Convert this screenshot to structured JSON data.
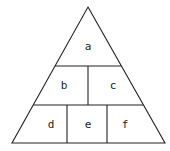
{
  "diagram": {
    "type": "pyramid",
    "stroke_color": "#222222",
    "fill_color": "#ffffff",
    "levels": [
      {
        "row": 1,
        "cells": [
          {
            "id": "a",
            "label": "a"
          }
        ]
      },
      {
        "row": 2,
        "cells": [
          {
            "id": "b",
            "label": "b"
          },
          {
            "id": "c",
            "label": "c"
          }
        ]
      },
      {
        "row": 3,
        "cells": [
          {
            "id": "d",
            "label": "d"
          },
          {
            "id": "e",
            "label": "e"
          },
          {
            "id": "f",
            "label": "f"
          }
        ]
      }
    ]
  },
  "labels": {
    "a": "a",
    "b": "b",
    "c": "c",
    "d": "d",
    "e": "e",
    "f": "f"
  }
}
